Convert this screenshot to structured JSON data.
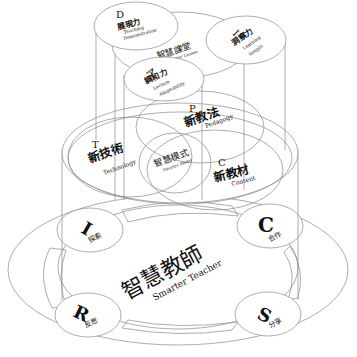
{
  "diagram": {
    "title_cn": "智慧教師",
    "title_en": "Smarter Teacher",
    "colors": {
      "line": "#8a8a8a",
      "text": "#111111",
      "background": "#ffffff"
    },
    "top_tier": {
      "center_cn": "智慧課堂",
      "center_en": "Smarter Lesson",
      "nodes": [
        {
          "letter": "D",
          "cn": "展現力",
          "en1": "Teaching",
          "en2": "Demonstration"
        },
        {
          "letter": "I",
          "cn": "洞察力",
          "en1": "Learning",
          "en2": "Insight"
        },
        {
          "letter": "A",
          "cn": "調和力",
          "en1": "Lecture",
          "en2": "Adaptability"
        }
      ]
    },
    "middle_tier": {
      "center_cn": "智慧模式",
      "center_en": "Smarter Model",
      "nodes": [
        {
          "letter": "T",
          "cn": "新技術",
          "en": "Technology"
        },
        {
          "letter": "P",
          "cn": "新教法",
          "en": "Pedagogy"
        },
        {
          "letter": "C",
          "cn": "新教材",
          "en": "Content"
        }
      ]
    },
    "bottom_tier": {
      "nodes": [
        {
          "letter": "I",
          "cn": "探索"
        },
        {
          "letter": "C",
          "cn": "合作"
        },
        {
          "letter": "R",
          "cn": "反思"
        },
        {
          "letter": "S",
          "cn": "分享"
        }
      ]
    }
  }
}
